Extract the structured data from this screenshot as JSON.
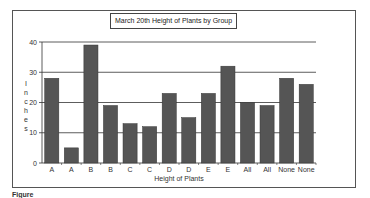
{
  "chart_data": {
    "type": "bar",
    "title": "March 20th Height of Plants by Group",
    "xlabel": "Height of Plants",
    "ylabel": "Inches",
    "categories": [
      "A",
      "A",
      "B",
      "B",
      "C",
      "C",
      "D",
      "D",
      "E",
      "E",
      "All",
      "All",
      "None",
      "None"
    ],
    "values": [
      28,
      5,
      39,
      19,
      13,
      12,
      23,
      15,
      23,
      32,
      20,
      19,
      28,
      26
    ],
    "ylim": [
      0,
      40
    ],
    "yticks": [
      0,
      10,
      20,
      30,
      40
    ],
    "grid": true,
    "legend": "none",
    "bar_color": "#555555"
  },
  "caption": "Figure"
}
